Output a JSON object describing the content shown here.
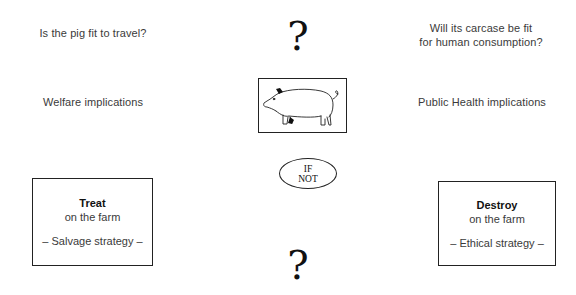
{
  "left": {
    "question": "Is the pig fit to travel?",
    "implications": "Welfare implications",
    "box": {
      "title": "Treat",
      "subtitle": "on the farm",
      "strategy": "– Salvage strategy –"
    }
  },
  "right": {
    "question_line1": "Will its carcase be fit",
    "question_line2": "for human consumption?",
    "implications": "Public Health implications",
    "box": {
      "title": "Destroy",
      "subtitle": "on the farm",
      "strategy": "– Ethical strategy –"
    }
  },
  "center": {
    "top_symbol": "?",
    "pig_icon": "pig-icon",
    "condition_line1": "IF",
    "condition_line2": "NOT",
    "bottom_symbol": "?"
  }
}
